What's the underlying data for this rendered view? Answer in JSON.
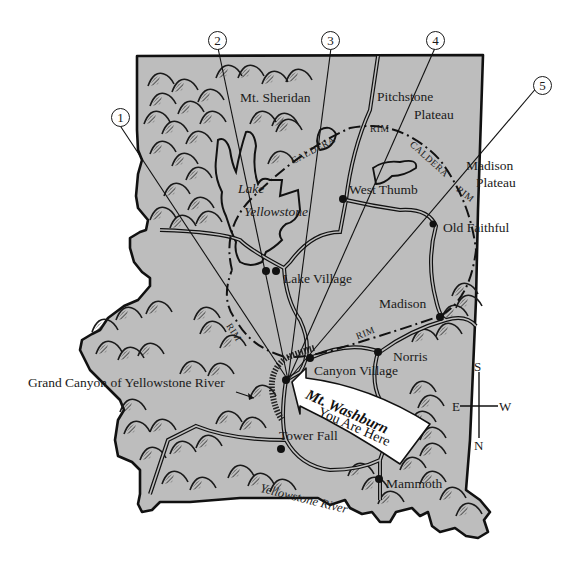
{
  "map": {
    "colors": {
      "land": "#bdbdbd",
      "border": "#111111",
      "background": "#ffffff",
      "arrow_fill": "#ffffff"
    },
    "callouts": [
      {
        "number": "1",
        "x": 113,
        "y": 114
      },
      {
        "number": "2",
        "x": 209,
        "y": 31
      },
      {
        "number": "3",
        "x": 332,
        "y": 31
      },
      {
        "number": "4",
        "x": 436,
        "y": 31
      },
      {
        "number": "5",
        "x": 544,
        "y": 76
      }
    ],
    "places": [
      {
        "name": "Mt. Sheridan",
        "italic": false
      },
      {
        "name": "Pitchstone",
        "italic": false
      },
      {
        "name": "Plateau",
        "italic": false
      },
      {
        "name": "Lake",
        "italic": true
      },
      {
        "name": "Yellowstone",
        "italic": true
      },
      {
        "name": "West Thumb",
        "italic": false
      },
      {
        "name": "Madison",
        "italic": false
      },
      {
        "name": "Plateau",
        "italic": false
      },
      {
        "name": "Old Faithful",
        "italic": false
      },
      {
        "name": "Lake Village",
        "italic": false
      },
      {
        "name": "Madison",
        "italic": false
      },
      {
        "name": "Norris",
        "italic": false
      },
      {
        "name": "Canyon Village",
        "italic": false
      },
      {
        "name": "Grand Canyon of Yellowstone River",
        "italic": false
      },
      {
        "name": "Tower Fall",
        "italic": false
      },
      {
        "name": "Mammoth",
        "italic": false
      },
      {
        "name": "Yellowstone River",
        "italic": true
      }
    ],
    "caldera_labels": [
      "RIM",
      "CALDERA",
      "CALDERA",
      "RIM",
      "RIM",
      "RIM"
    ],
    "you_are_here": {
      "title": "Mt. Washburn",
      "subtitle": "You Are Here"
    },
    "compass": {
      "top": "S",
      "left": "E",
      "right": "W",
      "bottom": "N"
    }
  }
}
